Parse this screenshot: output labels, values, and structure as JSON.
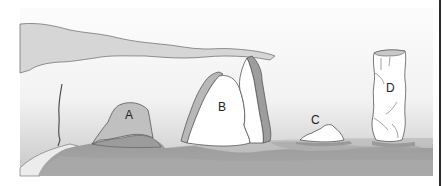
{
  "diagram": {
    "labels": [
      {
        "id": "A",
        "text": "A",
        "x": 129,
        "y": 119
      },
      {
        "id": "B",
        "text": "B",
        "x": 222,
        "y": 111
      },
      {
        "id": "C",
        "text": "C",
        "x": 315,
        "y": 124
      },
      {
        "id": "D",
        "text": "D",
        "x": 390,
        "y": 92
      }
    ]
  },
  "colors": {
    "sky_top": "#fbfbfb",
    "sky_bottom": "#ececec",
    "cliff_band": "#d4d4d4",
    "cliff_band_dark": "#a8a8a8",
    "rock_face": "#ffffff",
    "rock_outline": "#555555",
    "hill_light": "#c2c2c2",
    "ground_dark": "#9e9e9e",
    "sea": "#b7b7b7",
    "edge_line": "#2a2a2a"
  }
}
